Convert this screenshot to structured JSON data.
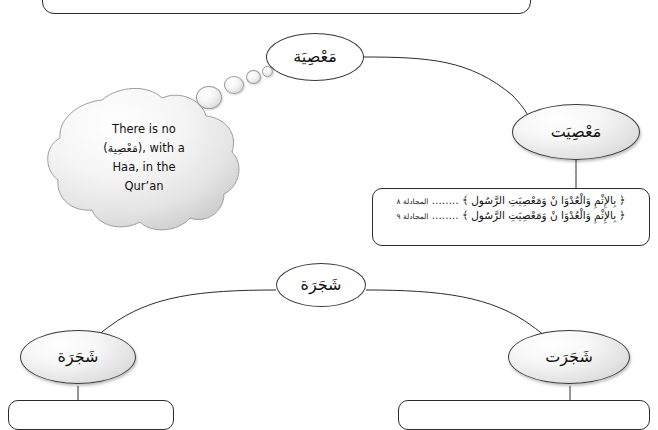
{
  "diagram": {
    "title_tab": "",
    "nodes": [
      {
        "id": "masiya",
        "label": "مَعْصِيَة",
        "shape": "ellipse-plain"
      },
      {
        "id": "masiyat",
        "label": "مَعْصِيَت",
        "shape": "ellipse-shaded"
      },
      {
        "id": "shajara",
        "label": "شَجَرَة",
        "shape": "ellipse-plain"
      },
      {
        "id": "shajarah_left",
        "label": "شَجَرَة",
        "shape": "ellipse-shaded"
      },
      {
        "id": "shajarat_right",
        "label": "شَجَرَت",
        "shape": "ellipse-shaded"
      }
    ],
    "verse_box": {
      "lines": [
        {
          "text": "﴿ بِالإِثْمِ وَالْعُدْوَا نْ وَمَعْصِيَتِ الرَّسُول ﴾",
          "ref": "المجادلة ٨"
        },
        {
          "text": "﴿ بِالإِثْمِ وَالْعُدْوَا نْ وَمَعْصِيَتِ الرَّسُول ﴾",
          "ref": "المجادلة ٩"
        }
      ]
    },
    "cloud": {
      "line1": "There is no",
      "line2_pre": "(",
      "line2_arabic": "مَعْصِية",
      "line2_post": "), with a",
      "line3": "Haa, in the",
      "line4": "Qur’an"
    }
  },
  "colors": {
    "stroke": "#2b2b2b",
    "text": "#111111",
    "node_fill": "#ffffff",
    "shaded_fill": "#e2e2e2"
  }
}
